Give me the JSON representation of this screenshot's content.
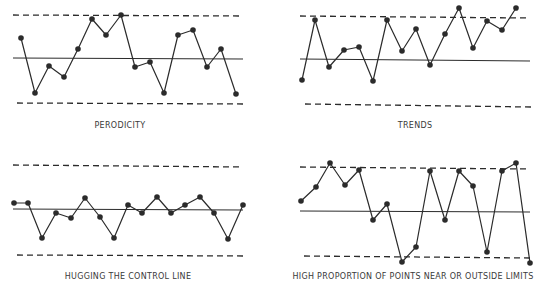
{
  "chart_data": [
    {
      "type": "line",
      "title": "PERODICITY",
      "caption_pos": [
        120,
        128
      ],
      "limits": {
        "ucl": [
          13,
          15,
          243,
          16
        ],
        "cl": [
          13,
          58,
          243,
          59
        ],
        "lcl": [
          17,
          103,
          245,
          104
        ]
      },
      "points": [
        [
          21,
          38
        ],
        [
          35,
          93
        ],
        [
          49,
          66
        ],
        [
          64,
          77
        ],
        [
          78,
          49
        ],
        [
          92,
          19
        ],
        [
          106,
          35
        ],
        [
          121,
          15
        ],
        [
          135,
          67
        ],
        [
          150,
          62
        ],
        [
          164,
          93
        ],
        [
          178,
          35
        ],
        [
          193,
          30
        ],
        [
          207,
          67
        ],
        [
          221,
          49
        ],
        [
          236,
          94
        ]
      ]
    },
    {
      "type": "line",
      "title": "TRENDS",
      "caption_pos": [
        415,
        128
      ],
      "limits": {
        "ucl": [
          300,
          16,
          530,
          18
        ],
        "cl": [
          300,
          59,
          530,
          61
        ],
        "lcl": [
          305,
          104,
          531,
          107
        ]
      },
      "points": [
        [
          302,
          80
        ],
        [
          315,
          20
        ],
        [
          329,
          67
        ],
        [
          344,
          50
        ],
        [
          359,
          47
        ],
        [
          373,
          81
        ],
        [
          387,
          20
        ],
        [
          402,
          51
        ],
        [
          416,
          29
        ],
        [
          430,
          65
        ],
        [
          445,
          34
        ],
        [
          459,
          8
        ],
        [
          473,
          48
        ],
        [
          487,
          21
        ],
        [
          502,
          30
        ],
        [
          516,
          8
        ]
      ]
    },
    {
      "type": "line",
      "title": "HUGGING THE CONTROL LINE",
      "caption_pos": [
        128,
        279
      ],
      "limits": {
        "ucl": [
          13,
          165,
          243,
          167
        ],
        "cl": [
          13,
          209,
          243,
          210
        ],
        "lcl": [
          17,
          255,
          244,
          256
        ]
      },
      "points": [
        [
          14,
          203
        ],
        [
          28,
          203
        ],
        [
          42,
          238
        ],
        [
          56,
          213
        ],
        [
          71,
          218
        ],
        [
          85,
          198
        ],
        [
          100,
          217
        ],
        [
          114,
          238
        ],
        [
          128,
          205
        ],
        [
          142,
          213
        ],
        [
          157,
          197
        ],
        [
          171,
          213
        ],
        [
          185,
          205
        ],
        [
          200,
          197
        ],
        [
          214,
          213
        ],
        [
          228,
          239
        ],
        [
          243,
          205
        ]
      ]
    },
    {
      "type": "line",
      "title": "HIGH PROPORTION OF POINTS NEAR OR OUTSIDE LIMITS",
      "caption_pos": [
        413,
        279
      ],
      "limits": {
        "ucl": [
          300,
          167,
          530,
          169
        ],
        "cl": [
          300,
          211,
          530,
          212
        ],
        "lcl": [
          304,
          256,
          530,
          258
        ]
      },
      "points": [
        [
          301,
          201
        ],
        [
          316,
          187
        ],
        [
          330,
          163
        ],
        [
          345,
          185
        ],
        [
          359,
          170
        ],
        [
          373,
          220
        ],
        [
          387,
          204
        ],
        [
          402,
          262
        ],
        [
          416,
          247
        ],
        [
          430,
          171
        ],
        [
          445,
          220
        ],
        [
          459,
          171
        ],
        [
          473,
          186
        ],
        [
          487,
          252
        ],
        [
          502,
          171
        ],
        [
          516,
          163
        ],
        [
          530,
          263
        ]
      ]
    }
  ],
  "style": {
    "ink": "#2b2b2b",
    "line_width": 1.2,
    "marker_radius": 2.8
  }
}
